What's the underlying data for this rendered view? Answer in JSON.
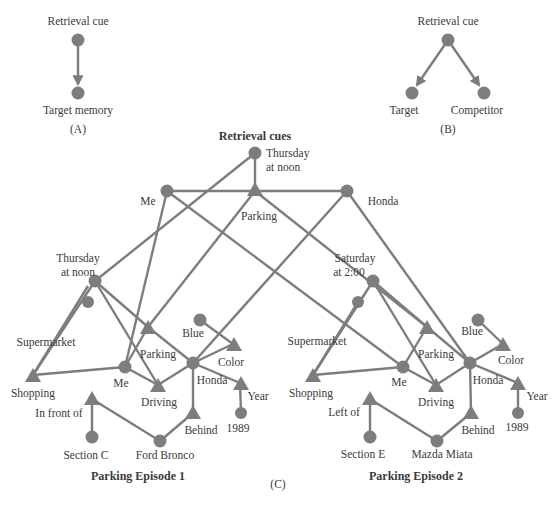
{
  "colors": {
    "node": "#7d7d7d",
    "edge": "#7d7d7d",
    "text": "#3a3a3a",
    "background": "#ffffff"
  },
  "panelA": {
    "label": "(A)",
    "cue_label": "Retrieval cue",
    "target_label": "Target memory"
  },
  "panelB": {
    "label": "(B)",
    "cue_label": "Retrieval cue",
    "target_label": "Target",
    "competitor_label": "Competitor"
  },
  "panelC": {
    "label": "(C)",
    "title": "Retrieval cues",
    "cues": {
      "time_line1": "Thursday",
      "time_line2": "at noon",
      "me": "Me",
      "parking": "Parking",
      "honda": "Honda"
    },
    "episode1": {
      "title": "Parking Episode 1",
      "time_line1": "Thursday",
      "time_line2": "at noon",
      "supermarket": "Supermarket",
      "shopping": "Shopping",
      "parking": "Parking",
      "me": "Me",
      "driving": "Driving",
      "blue": "Blue",
      "color": "Color",
      "honda": "Honda",
      "year": "Year",
      "year_value": "1989",
      "relation": "In front of",
      "section": "Section C",
      "car": "Ford Bronco",
      "behind": "Behind"
    },
    "episode2": {
      "title": "Parking Episode 2",
      "time_line1": "Saturday",
      "time_line2": "at 2:00",
      "supermarket": "Supermarket",
      "shopping": "Shopping",
      "parking": "Parking",
      "me": "Me",
      "driving": "Driving",
      "blue": "Blue",
      "color": "Color",
      "honda": "Honda",
      "year": "Year",
      "year_value": "1989",
      "relation": "Left of",
      "section": "Section E",
      "car": "Mazda Miata",
      "behind": "Behind"
    }
  }
}
